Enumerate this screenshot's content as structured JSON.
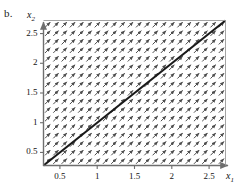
{
  "figure": {
    "panel_label": "b.",
    "background_color": "#ffffff",
    "frame_color": "#6e6e6e",
    "solution_line_color": "#1a1a1a",
    "arrow_color": "#4d4d4d"
  },
  "axes": {
    "x_axis_label": "x",
    "x_axis_subscript": "1",
    "y_axis_label": "x",
    "y_axis_subscript": "2",
    "x_ticks": [
      "0.5",
      "1",
      "1.5",
      "2",
      "2.5"
    ],
    "y_ticks": [
      "0.5",
      "1",
      "1.5",
      "2",
      "2.5"
    ],
    "x_tick_values": [
      0.5,
      1,
      1.5,
      2,
      2.5
    ],
    "y_tick_values": [
      0.5,
      1,
      1.5,
      2,
      2.5
    ],
    "xlim": [
      0.28,
      2.72
    ],
    "ylim": [
      0.28,
      2.72
    ],
    "x_arrowhead": true,
    "y_arrowhead": true
  },
  "chart_data": {
    "type": "scatter",
    "title": "",
    "subtitle": "",
    "xlabel": "x1",
    "ylabel": "x2",
    "xlim": [
      0.28,
      2.72
    ],
    "ylim": [
      0.28,
      2.72
    ],
    "grid": false,
    "legend": null,
    "plot_kind": "slope-field-with-solution-curve",
    "vector_field": {
      "columns": 22,
      "rows": 17,
      "angle_degrees": 45,
      "direction": "up-right",
      "uniform": true,
      "arrow_length_px": 7.4,
      "arrow_head": "filled-triangle"
    },
    "series": [
      {
        "name": "solution x2 = x1",
        "type": "line",
        "slope": 1,
        "intercept": 0,
        "x": [
          0.28,
          2.72
        ],
        "values": [
          0.28,
          2.72
        ],
        "linewidth_px": 2.1,
        "color": "#1a1a1a"
      }
    ]
  }
}
